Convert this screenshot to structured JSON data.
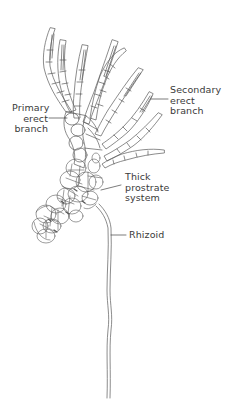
{
  "figure": {
    "labels": {
      "primary_erect_branch": [
        "Primary",
        "erect",
        "branch"
      ],
      "secondary_erect_branch": [
        "Secondary",
        "erect",
        "branch"
      ],
      "thick_prostrate_system": [
        "Thick",
        "prostrate",
        "system"
      ],
      "rhizoid": "Rhizoid"
    },
    "colors": {
      "background": "#ffffff",
      "line": "#555555",
      "text": "#3a3a3a"
    }
  }
}
